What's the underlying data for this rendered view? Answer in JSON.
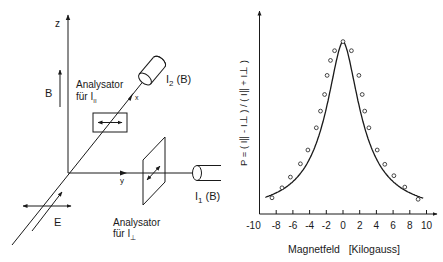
{
  "diagram": {
    "axis_z": "z",
    "axis_x": "x",
    "axis_y": "y",
    "field_b": "B",
    "field_e": "E",
    "analyzer_par_line1": "Analysator",
    "analyzer_par_line2": "für  I",
    "analyzer_par_sub": "II",
    "analyzer_perp_line1": "Analysator",
    "analyzer_perp_line2": "für  I",
    "analyzer_perp_sub": "⊥",
    "detector2_label": "I",
    "detector2_sub": "2",
    "detector2_suffix": " (B)",
    "detector1_label": "I",
    "detector1_sub": "1",
    "detector1_suffix": " (B)"
  },
  "chart_data": {
    "type": "line",
    "title": "",
    "xlabel": "Magnetfeld   [Kilogauss]",
    "ylabel": "P = ( I∥ - I⊥ ) / ( I∥ + I⊥ )",
    "xlim": [
      -10,
      10
    ],
    "ylim": [
      0,
      1.2
    ],
    "x_ticks": [
      -10,
      -8,
      -6,
      -4,
      -2,
      0,
      2,
      4,
      6,
      8,
      10
    ],
    "x_tick_labels": [
      "-10",
      "-8",
      "-6",
      "-4",
      "-2",
      "0",
      "2",
      "4",
      "6",
      "8",
      "10"
    ],
    "y_ticks": [],
    "grid": false,
    "legend": null,
    "units_note": "y values normalized to peak = 1 (no y tick labels shown)",
    "series": [
      {
        "name": "measured",
        "marker": "open-circle",
        "x": [
          -8.5,
          -7.3,
          -6.3,
          -5.1,
          -4.2,
          -3.2,
          -2.7,
          -2.2,
          -1.9,
          -1.5,
          -1.0,
          0.0,
          1.0,
          1.9,
          2.3,
          2.6,
          3.1,
          4.1,
          5.0,
          6.1,
          7.4,
          9.0
        ],
        "values": [
          0.094,
          0.152,
          0.214,
          0.291,
          0.371,
          0.5,
          0.597,
          0.693,
          0.804,
          0.891,
          0.947,
          1.0,
          0.947,
          0.804,
          0.693,
          0.597,
          0.5,
          0.371,
          0.288,
          0.222,
          0.156,
          0.085
        ]
      },
      {
        "name": "fit",
        "marker": "none",
        "x": [
          -9.3,
          9.6
        ],
        "values": [
          0.07,
          0.05
        ]
      }
    ]
  }
}
